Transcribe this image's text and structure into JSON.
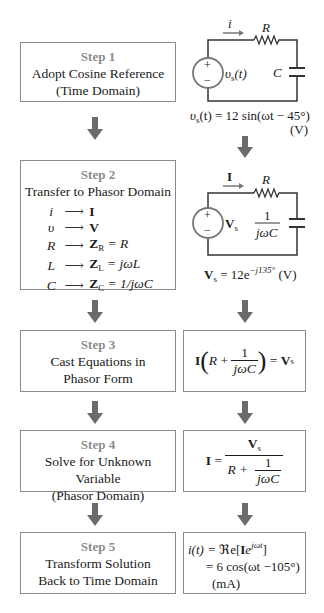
{
  "colors": {
    "step_label": "#8c8c8c",
    "box_border": "#8a8a8a",
    "arrow": "#6b6b6b",
    "wire": "#333333",
    "source_ring": "#777777"
  },
  "steps": [
    {
      "label": "Step 1",
      "lines": [
        "Adopt Cosine Reference",
        "(Time Domain)"
      ]
    },
    {
      "label": "Step 2",
      "lines": [
        "Transfer to Phasor Domain"
      ],
      "mappings": [
        {
          "from": "i",
          "to": "I",
          "rhs": ""
        },
        {
          "from": "υ",
          "to": "V",
          "rhs": ""
        },
        {
          "from": "R",
          "to": "Z",
          "to_sub": "R",
          "rhs": " = R"
        },
        {
          "from": "L",
          "to": "Z",
          "to_sub": "L",
          "rhs": " = jωL"
        },
        {
          "from": "C",
          "to": "Z",
          "to_sub": "C",
          "rhs": " = 1/jωC"
        }
      ]
    },
    {
      "label": "Step 3",
      "lines": [
        "Cast Equations in",
        "Phasor Form"
      ]
    },
    {
      "label": "Step 4",
      "lines": [
        "Solve for Unknown Variable",
        "(Phasor Domain)"
      ]
    },
    {
      "label": "Step 5",
      "lines": [
        "Transform Solution",
        "Back to Time Domain"
      ]
    }
  ],
  "circuit_time": {
    "current_label": "i",
    "resistor_label": "R",
    "capacitor_label": "C",
    "source_label": "υ",
    "source_sub": "s",
    "source_arg": "(t)",
    "plus": "+",
    "minus": "−",
    "equation_lhs": "υ",
    "equation_sub": "s",
    "equation_rest": "(t) = 12 sin(ωt − 45°)",
    "equation_unit": "(V)"
  },
  "circuit_phasor": {
    "current_label": "I",
    "resistor_label": "R",
    "capacitor_num": "1",
    "capacitor_den": "jωC",
    "source_label": "V",
    "source_sub": "s",
    "plus": "+",
    "minus": "−",
    "equation_lhs": "V",
    "equation_sub": "s",
    "equation_eq": " = 12e",
    "equation_exp": "−j135°",
    "equation_unit": " (V)"
  },
  "eq_step3": {
    "I": "I",
    "R": "R",
    "plus": " + ",
    "num": "1",
    "den": "jωC",
    "eq": " = ",
    "V": "V",
    "V_sub": "s"
  },
  "eq_step4": {
    "I": "I",
    "eq": " = ",
    "num_V": "V",
    "num_sub": "s",
    "den_R": "R + ",
    "den_num": "1",
    "den_den": "jωC"
  },
  "eq_step5": {
    "line1_lhs": "i(t) = ",
    "line1_re": "ℜe",
    "line1_open": "[",
    "line1_I": "I",
    "line1_e": "e",
    "line1_exp": "jωt",
    "line1_close": "]",
    "line2": "= 6 cos(ωt −105°)",
    "line3": "(mA)"
  }
}
